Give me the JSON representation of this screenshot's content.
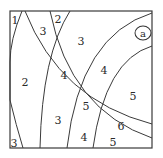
{
  "diagram": {
    "frame": {
      "x": 10,
      "y": 11,
      "width": 142,
      "height": 137,
      "stroke": "#3a3a3a"
    },
    "curve_color": "#3a3a3a",
    "corner_label": {
      "text": "a",
      "x": 143,
      "y": 33
    },
    "regions": [
      {
        "text": "1",
        "x": 15,
        "y": 20
      },
      {
        "text": "3",
        "x": 43,
        "y": 31
      },
      {
        "text": "2",
        "x": 58,
        "y": 19
      },
      {
        "text": "3",
        "x": 81,
        "y": 41
      },
      {
        "text": "2",
        "x": 25,
        "y": 82
      },
      {
        "text": "4",
        "x": 64,
        "y": 75
      },
      {
        "text": "4",
        "x": 104,
        "y": 70
      },
      {
        "text": "5",
        "x": 133,
        "y": 96
      },
      {
        "text": "5",
        "x": 86,
        "y": 106
      },
      {
        "text": "3",
        "x": 58,
        "y": 120
      },
      {
        "text": "6",
        "x": 121,
        "y": 126
      },
      {
        "text": "4",
        "x": 84,
        "y": 137
      },
      {
        "text": "5",
        "x": 113,
        "y": 142
      },
      {
        "text": "3",
        "x": 14,
        "y": 143
      }
    ]
  }
}
